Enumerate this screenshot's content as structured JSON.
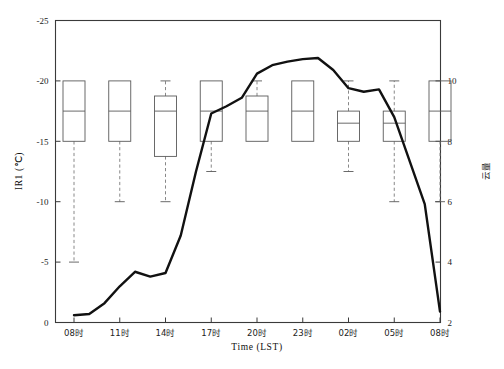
{
  "chart_data": {
    "type": "line",
    "title": "",
    "xlabel": "Time (LST)",
    "ylabel": "IR1 (℃)",
    "y2label": "云量",
    "categories": [
      "08时",
      "11时",
      "14时",
      "17时",
      "20时",
      "23时",
      "02时",
      "05时",
      "08时"
    ],
    "x_tick_labels": [
      "08时",
      "11时",
      "14时",
      "17时",
      "20时",
      "23时",
      "02时",
      "05时",
      "08时"
    ],
    "y_tick_labels": [
      "-25",
      "-20",
      "-15",
      "-10",
      "-5",
      "0"
    ],
    "y_ticks": [
      -25,
      -20,
      -15,
      -10,
      -5,
      0
    ],
    "ylim": [
      0,
      -25
    ],
    "y2_tick_labels": [
      "10",
      "8",
      "6",
      "4",
      "2"
    ],
    "y2_ticks": [
      10,
      8,
      6,
      4,
      2
    ],
    "y2lim": [
      2,
      10
    ],
    "grid": false,
    "legend": "none",
    "axis_inverted_note": "left axis decreasing upward (-25 at top, 0 at bottom)",
    "series": [
      {
        "name": "IR1 brightness temperature",
        "type": "line",
        "axis": "left",
        "x": [
          0,
          1,
          2,
          3,
          4,
          5,
          6,
          7,
          8,
          9,
          10,
          11,
          12,
          13,
          14,
          15,
          16,
          17,
          18,
          19,
          20,
          21,
          22,
          23,
          24
        ],
        "x_hours": [
          "08",
          "09",
          "10",
          "11",
          "12",
          "13",
          "14",
          "15",
          "16",
          "17",
          "18",
          "19",
          "20",
          "21",
          "22",
          "23",
          "00",
          "01",
          "02",
          "03",
          "04",
          "05",
          "06",
          "07",
          "08"
        ],
        "values": [
          -0.6,
          -0.7,
          -1.6,
          -3.0,
          -4.2,
          -3.8,
          -4.1,
          -7.2,
          -12.5,
          -17.3,
          -17.9,
          -18.6,
          -20.6,
          -21.3,
          -21.6,
          -21.8,
          -21.9,
          -20.9,
          -19.4,
          -19.1,
          -19.3,
          -17.0,
          -13.4,
          -9.8,
          -0.9
        ]
      }
    ],
    "boxplots": {
      "axis": "right",
      "description": "cloud amount box-and-whisker per 3-hour observation",
      "boxes": [
        {
          "category": "08时",
          "q3": 10.0,
          "median": 9.0,
          "q1": 8.0,
          "upper_whisker": 10.0,
          "lower_whisker": 4.0
        },
        {
          "category": "11时",
          "q3": 10.0,
          "median": 9.0,
          "q1": 8.0,
          "upper_whisker": 10.0,
          "lower_whisker": 6.0
        },
        {
          "category": "14时",
          "q3": 9.5,
          "median": 9.0,
          "q1": 7.5,
          "upper_whisker": 10.0,
          "lower_whisker": 6.0
        },
        {
          "category": "17时",
          "q3": 10.0,
          "median": 9.0,
          "q1": 8.0,
          "upper_whisker": 10.0,
          "lower_whisker": 7.0
        },
        {
          "category": "20时",
          "q3": 9.5,
          "median": 9.0,
          "q1": 8.0,
          "upper_whisker": 10.0,
          "lower_whisker": 10.0
        },
        {
          "category": "23时",
          "q3": 10.0,
          "median": 9.0,
          "q1": 8.0,
          "upper_whisker": 10.0,
          "lower_whisker": 8.0
        },
        {
          "category": "02时",
          "q3": 9.0,
          "median": 8.6,
          "q1": 8.0,
          "upper_whisker": 10.0,
          "lower_whisker": 7.0
        },
        {
          "category": "05时",
          "q3": 9.0,
          "median": 8.6,
          "q1": 8.0,
          "upper_whisker": 10.0,
          "lower_whisker": 6.0
        },
        {
          "category": "08时",
          "q3": 10.0,
          "median": 9.0,
          "q1": 8.0,
          "upper_whisker": 10.0,
          "lower_whisker": 6.0
        }
      ]
    },
    "colors": {
      "series_line": "#111111",
      "box_stroke": "#5a5a5a",
      "whisker_stroke": "#7a7a7a",
      "frame": "#3a3a3a",
      "background": "#ffffff"
    }
  },
  "caption": {
    "text": ""
  }
}
